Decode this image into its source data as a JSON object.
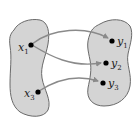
{
  "diagram": {
    "domain_set": {
      "points": [
        {
          "id": "x1",
          "label": "x",
          "subscript": "1"
        },
        {
          "id": "x3",
          "label": "x",
          "subscript": "3"
        }
      ]
    },
    "codomain_set": {
      "points": [
        {
          "id": "y1",
          "label": "y",
          "subscript": "1"
        },
        {
          "id": "y2",
          "label": "y",
          "subscript": "2"
        },
        {
          "id": "y3",
          "label": "y",
          "subscript": "3"
        }
      ]
    },
    "arrows": [
      {
        "from": "x1",
        "to": "y1"
      },
      {
        "from": "x1",
        "to": "y2"
      },
      {
        "from": "x3",
        "to": "y3"
      }
    ],
    "colors": {
      "set_fill": "#d4d4d4",
      "set_stroke": "#6a6a6a",
      "arrow": "#8a8a8a",
      "point": "#000000"
    }
  }
}
